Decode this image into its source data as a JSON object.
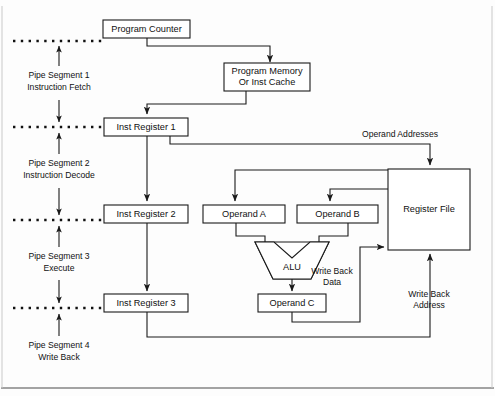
{
  "figure": {
    "background_color": "#fdfdfd",
    "line_color": "#1a1a1a"
  },
  "pipe_segments": [
    {
      "id": "seg1",
      "line1": "Pipe Segment 1",
      "line2": "Instruction Fetch"
    },
    {
      "id": "seg2",
      "line1": "Pipe Segment 2",
      "line2": "Instruction Decode"
    },
    {
      "id": "seg3",
      "line1": "Pipe Segment 3",
      "line2": "Execute"
    },
    {
      "id": "seg4",
      "line1": "Pipe Segment 4",
      "line2": "Write Back"
    }
  ],
  "blocks": {
    "program_counter": "Program Counter",
    "program_memory_line1": "Program Memory",
    "program_memory_line2": "Or Inst Cache",
    "inst_register_1": "Inst Register 1",
    "inst_register_2": "Inst Register 2",
    "inst_register_3": "Inst Register 3",
    "operand_a": "Operand A",
    "operand_b": "Operand B",
    "operand_c": "Operand C",
    "alu": "ALU",
    "register_file": "Register File"
  },
  "edge_labels": {
    "operand_addresses": "Operand Addresses",
    "write_back_data_line1": "Write Back",
    "write_back_data_line2": "Data",
    "write_back_address_line1": "Write Back",
    "write_back_address_line2": "Address"
  }
}
